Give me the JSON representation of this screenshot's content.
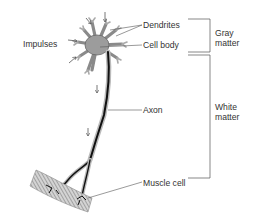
{
  "diagram": {
    "labels": {
      "impulses": "Impulses",
      "dendrites": "Dendrites",
      "cell_body": "Cell body",
      "axon": "Axon",
      "muscle_cell": "Muscle cell"
    },
    "regions": {
      "gray_matter": {
        "line1": "Gray",
        "line2": "matter"
      },
      "white_matter": {
        "line1": "White",
        "line2": "matter"
      }
    },
    "colors": {
      "line": "#444444",
      "text": "#333333",
      "stipple": "#9a9a9a",
      "axon": "#111111",
      "muscle_fill": "#b8b8b8"
    }
  }
}
